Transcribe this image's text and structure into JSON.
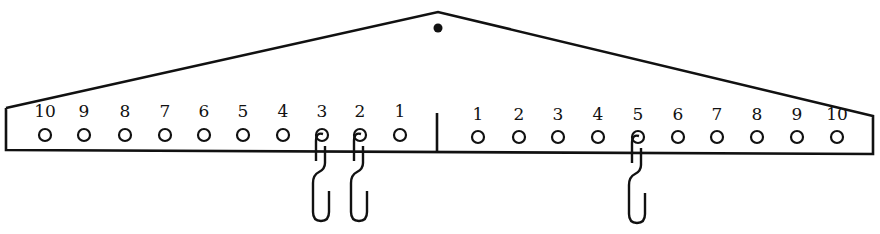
{
  "diagram": {
    "type": "balance-beam",
    "stroke_color": "#111111",
    "background": "#ffffff",
    "pivot": {
      "label": "pivot-dot",
      "x": 438,
      "y": 28
    },
    "left_arm": {
      "labels": [
        "10",
        "9",
        "8",
        "7",
        "6",
        "5",
        "4",
        "3",
        "2",
        "1"
      ],
      "peg_x": [
        45,
        84,
        125,
        165,
        204,
        243,
        283,
        322,
        360,
        400
      ]
    },
    "right_arm": {
      "labels": [
        "1",
        "2",
        "3",
        "4",
        "5",
        "6",
        "7",
        "8",
        "9",
        "10"
      ],
      "peg_x": [
        478,
        519,
        558,
        598,
        638,
        678,
        717,
        757,
        797,
        837
      ]
    },
    "hooks": [
      {
        "side": "left",
        "position": "3",
        "count": 1
      },
      {
        "side": "left",
        "position": "2",
        "count": 1
      },
      {
        "side": "right",
        "position": "5",
        "count": 1
      }
    ]
  }
}
